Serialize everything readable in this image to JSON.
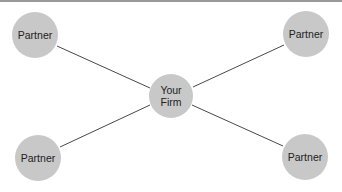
{
  "diagram": {
    "colors": {
      "node_fill": "#c8c8c8",
      "edge": "#333333",
      "text": "#222222",
      "top_bar": "#9a9a9a"
    },
    "center": {
      "label_line1": "Your",
      "label_line2": "Firm"
    },
    "partners": [
      {
        "label": "Partner",
        "position": "top-left"
      },
      {
        "label": "Partner",
        "position": "top-right"
      },
      {
        "label": "Partner",
        "position": "bottom-left"
      },
      {
        "label": "Partner",
        "position": "bottom-right"
      }
    ]
  }
}
